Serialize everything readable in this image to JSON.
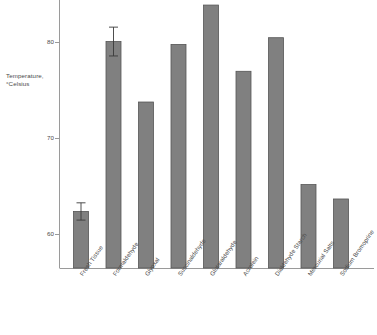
{
  "chart_data": {
    "type": "bar",
    "title": "",
    "subtitle": "",
    "xlabel": "",
    "ylabel": "Temperature, °Celsius",
    "ylabel_lines": [
      "Temperature,",
      "°Celsius"
    ],
    "ylim": [
      56.5,
      84.8
    ],
    "yticks": [
      60,
      70,
      80
    ],
    "ytick_labels": [
      "60",
      "70",
      "80"
    ],
    "grid": false,
    "legend": "none",
    "categories": [
      "Fresh Tissue",
      "Formaldehyde",
      "Glyoxal",
      "Succinaldehyde",
      "Glutaraldehyde",
      "Acrolein",
      "Dialdehyde Starch",
      "Mercurial Salts",
      "Sodium Bromoprine"
    ],
    "values": [
      62.4,
      80.1,
      73.8,
      79.8,
      83.9,
      77.0,
      80.5,
      65.2,
      63.7
    ],
    "errors": [
      0.9,
      1.5,
      null,
      null,
      null,
      null,
      null,
      null,
      null
    ],
    "bar_color": "#808080",
    "bar_edge_color": "#555555",
    "axis_color": "#808080",
    "text_color": "#4a4a4a"
  }
}
